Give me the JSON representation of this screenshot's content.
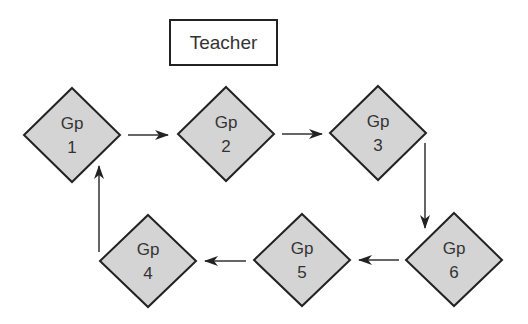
{
  "diagram": {
    "teacher": {
      "label": "Teacher"
    },
    "groups": [
      {
        "id": "gp1",
        "line1": "Gp",
        "line2": "1"
      },
      {
        "id": "gp2",
        "line1": "Gp",
        "line2": "2"
      },
      {
        "id": "gp3",
        "line1": "Gp",
        "line2": "3"
      },
      {
        "id": "gp4",
        "line1": "Gp",
        "line2": "4"
      },
      {
        "id": "gp5",
        "line1": "Gp",
        "line2": "5"
      },
      {
        "id": "gp6",
        "line1": "Gp",
        "line2": "6"
      }
    ],
    "edges": [
      {
        "from": "gp1",
        "to": "gp2"
      },
      {
        "from": "gp2",
        "to": "gp3"
      },
      {
        "from": "gp3",
        "to": "gp6"
      },
      {
        "from": "gp6",
        "to": "gp5"
      },
      {
        "from": "gp5",
        "to": "gp4"
      },
      {
        "from": "gp4",
        "to": "gp1"
      }
    ],
    "colors": {
      "node_fill": "#d4d4d4",
      "node_stroke": "#222222",
      "arrow": "#333333",
      "text": "#333333"
    }
  }
}
